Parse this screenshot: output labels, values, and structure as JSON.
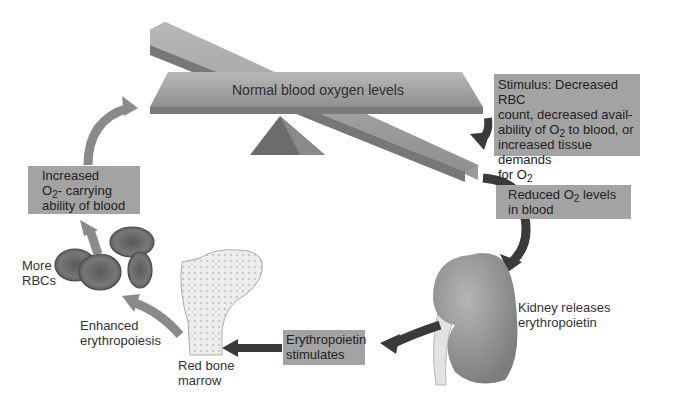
{
  "diagram": {
    "title_beam": "Normal blood oxygen levels",
    "stimulus": {
      "line1": "Stimulus: Decreased RBC",
      "line2": "count, decreased avail-",
      "line3_pre": "ability of O",
      "line3_sub": "2",
      "line3_post": " to blood, or",
      "line4": "increased tissue demands",
      "line5_pre": "for O",
      "line5_sub": "2"
    },
    "reduced": {
      "line1_pre": "Reduced O",
      "line1_sub": "2",
      "line1_post": " levels",
      "line2": "in blood"
    },
    "kidney": {
      "line1": "Kidney releases",
      "line2": "erythropoietin"
    },
    "epo": {
      "line1": "Erythropoietin",
      "line2": "stimulates"
    },
    "marrow": {
      "line1": "Red bone",
      "line2": "marrow"
    },
    "enhanced": {
      "line1": "Enhanced",
      "line2": "erythropoiesis"
    },
    "rbcs": {
      "line1": "More",
      "line2": "RBCs"
    },
    "increased": {
      "line1": "Increased",
      "line2_pre": "O",
      "line2_sub": "2",
      "line2_post": "- carrying",
      "line3": "ability of blood"
    },
    "colors": {
      "box": "#a3a3a3",
      "arrow_light": "#8a8a8a",
      "arrow_dark": "#3a3a3a",
      "beam": "#9c9c9c",
      "kidney": "#8e8e8e",
      "rbc": "#6a6a6a"
    }
  }
}
